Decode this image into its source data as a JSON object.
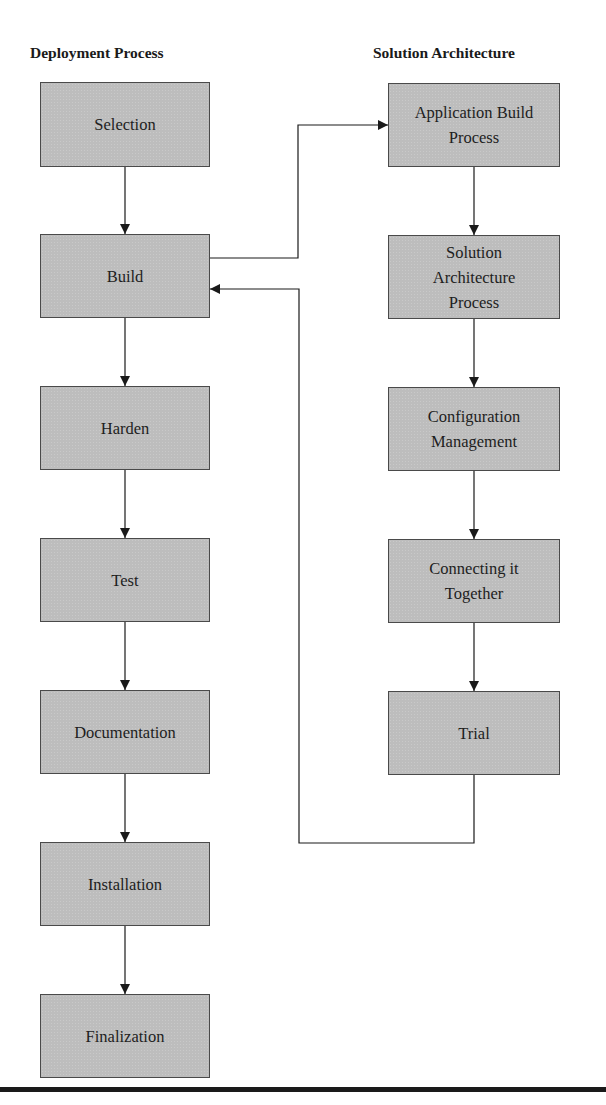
{
  "headings": {
    "left": "Deployment Process",
    "right": "Solution Architecture"
  },
  "deployment_process": [
    {
      "label": "Selection"
    },
    {
      "label": "Build"
    },
    {
      "label": "Harden"
    },
    {
      "label": "Test"
    },
    {
      "label": "Documentation"
    },
    {
      "label": "Installation"
    },
    {
      "label": "Finalization"
    }
  ],
  "solution_architecture": [
    {
      "label": "Application Build\nProcess"
    },
    {
      "label": "Solution\nArchitecture\nProcess"
    },
    {
      "label": "Configuration\nManagement"
    },
    {
      "label": "Connecting it\nTogether"
    },
    {
      "label": "Trial"
    }
  ],
  "connections": [
    {
      "from": "Build",
      "to": "Application Build Process"
    },
    {
      "from": "Trial",
      "to": "Build"
    }
  ],
  "colors": {
    "box_fill": "#bdbdbd",
    "box_border": "#4a4a4a",
    "line": "#1a1a1a"
  }
}
